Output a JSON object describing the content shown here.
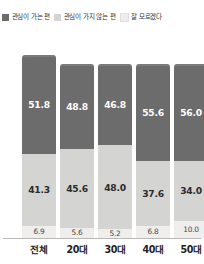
{
  "chart_data": {
    "type": "bar",
    "subtype": "stacked-vertical-100",
    "title": "",
    "xlabel": "",
    "ylabel": "",
    "ylim": [
      0,
      100
    ],
    "grid": false,
    "legend_position": "top",
    "categories": [
      "전체",
      "20대",
      "30대",
      "40대",
      "50대"
    ],
    "series": [
      {
        "name": "관심이 가는 편",
        "color": "#6d6c6c",
        "values": [
          51.8,
          48.8,
          46.8,
          55.6,
          56.0
        ],
        "labels": [
          "51.8",
          "48.8",
          "46.8",
          "55.6",
          "56.0"
        ]
      },
      {
        "name": "관심이 가지 않는 편",
        "color": "#d4d4d2",
        "values": [
          41.3,
          45.6,
          48.0,
          37.6,
          34.0
        ],
        "labels": [
          "41.3",
          "45.6",
          "48.0",
          "37.6",
          "34.0"
        ]
      },
      {
        "name": "잘 모르겠다",
        "color": "#efeeec",
        "values": [
          6.9,
          5.6,
          5.2,
          6.8,
          10.0
        ],
        "labels": [
          "6.9",
          "5.6",
          "5.2",
          "6.8",
          "10.0"
        ]
      }
    ]
  },
  "legend": {
    "items": [
      {
        "label": "관심이 가는 편",
        "color": "#6d6c6c"
      },
      {
        "label": "관심이 가지 않는 편",
        "color": "#d4d4d2"
      },
      {
        "label": "잘 모르겠다",
        "color": "#efeeec"
      }
    ]
  },
  "axis": {
    "categories": [
      "전체",
      "20대",
      "30대",
      "40대",
      "50대"
    ]
  }
}
